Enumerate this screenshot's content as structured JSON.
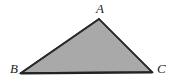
{
  "figure": {
    "name": "triangle-abc",
    "width": 177,
    "height": 83,
    "background_color": "#ffffff",
    "fill_color": "#a9a9a9",
    "stroke_color": "#2a2a2a",
    "label_color": "#1c1c1c",
    "base_stroke_color": "#232323"
  },
  "labels": {
    "apex": "A",
    "bottom_left": "B",
    "bottom_right": "C"
  },
  "geometry": {
    "points_attr": "99,19 152,72 21,73",
    "vertices": [
      {
        "name": "A",
        "x": 99,
        "y": 19
      },
      {
        "name": "B",
        "x": 21,
        "y": 73
      },
      {
        "name": "C",
        "x": 152,
        "y": 72
      }
    ],
    "edges": [
      {
        "name": "AB",
        "x1": 99,
        "y1": 19,
        "x2": 21,
        "y2": 73
      },
      {
        "name": "AC",
        "x1": 99,
        "y1": 19,
        "x2": 152,
        "y2": 72
      },
      {
        "name": "BC",
        "x1": 21,
        "y1": 73,
        "x2": 152,
        "y2": 72
      }
    ]
  }
}
